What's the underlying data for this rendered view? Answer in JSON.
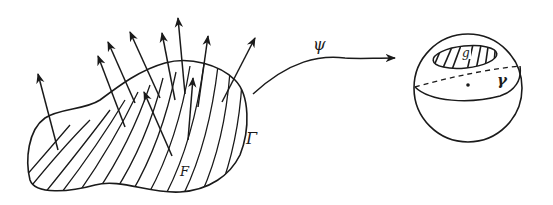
{
  "diagram": {
    "left_figure": {
      "region_label": "F",
      "boundary_label": "Γ",
      "normal_vector_count": 10
    },
    "mapping": {
      "label": "ψ"
    },
    "right_figure": {
      "image_label": "g",
      "curve_label": "γ",
      "center_point": "•"
    },
    "colors": {
      "ink": "#1a1a1a",
      "background": "#ffffff"
    }
  }
}
